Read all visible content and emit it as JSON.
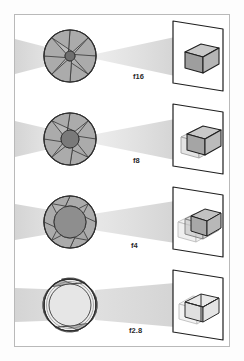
{
  "figure": {
    "name": "aperture-depth-of-field-diagram",
    "frame_color": "#b9b9b9",
    "background_color": "#ffffff",
    "beam_color": "#d4d4d4",
    "blade_fill": "#a8a8a8",
    "blade_stroke": "#3a3a3a",
    "box_fill_light": "#e2e2e2",
    "box_fill_mid": "#c9c9c9",
    "box_fill_dark": "#9e9e9e",
    "ink_color": "#2a2a2a"
  },
  "rows": [
    {
      "id": "row-f16",
      "fstop_label": "f16",
      "aperture": {
        "name": "aperture-f16",
        "blade_count": 8,
        "outer_radius": 35,
        "opening_radius": 5,
        "openness_percent": 14
      },
      "beam": {
        "name": "light-cone-f16",
        "left_half_height": 17,
        "right_half_height": 19,
        "waist_half_height": 2
      },
      "subject": {
        "name": "box-subject-f16",
        "blur_copies": 1,
        "ghost_offset": 0,
        "sharpness": "sharp",
        "depth_of_field": "deep"
      }
    },
    {
      "id": "row-f8",
      "fstop_label": "f8",
      "aperture": {
        "name": "aperture-f8",
        "blade_count": 8,
        "outer_radius": 35,
        "opening_radius": 9,
        "openness_percent": 26
      },
      "beam": {
        "name": "light-cone-f8",
        "left_half_height": 17,
        "right_half_height": 19,
        "waist_half_height": 4
      },
      "subject": {
        "name": "box-subject-f8",
        "blur_copies": 2,
        "ghost_offset": 5,
        "sharpness": "slightly-soft",
        "depth_of_field": "moderate"
      }
    },
    {
      "id": "row-f4",
      "fstop_label": "f4",
      "aperture": {
        "name": "aperture-f4",
        "blade_count": 8,
        "outer_radius": 35,
        "opening_radius": 16,
        "openness_percent": 46
      },
      "beam": {
        "name": "light-cone-f4",
        "left_half_height": 17,
        "right_half_height": 19,
        "waist_half_height": 8
      },
      "subject": {
        "name": "box-subject-f4",
        "blur_copies": 3,
        "ghost_offset": 9,
        "sharpness": "soft",
        "depth_of_field": "shallow"
      }
    },
    {
      "id": "row-f2.8",
      "fstop_label": "f2.8",
      "aperture": {
        "name": "aperture-f2-8",
        "blade_count": 8,
        "outer_radius": 35,
        "opening_radius": 27,
        "openness_percent": 77
      },
      "beam": {
        "name": "light-cone-f2-8",
        "left_half_height": 17,
        "right_half_height": 19,
        "waist_half_height": 15
      },
      "subject": {
        "name": "box-subject-f2-8",
        "blur_copies": 3,
        "ghost_offset": 15,
        "sharpness": "very-soft",
        "depth_of_field": "very-shallow"
      }
    }
  ]
}
